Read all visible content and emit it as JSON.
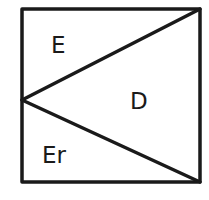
{
  "diagram": {
    "type": "square-partition",
    "stroke_color": "#1a1a1a",
    "background": "#ffffff",
    "square": {
      "x1": 22,
      "y1": 9,
      "x2": 200,
      "y2": 182
    },
    "apex": {
      "x": 22,
      "y": 100
    },
    "lines": [
      {
        "from": "apex",
        "to": "top-right"
      },
      {
        "from": "apex",
        "to": "bottom-right"
      }
    ],
    "regions": [
      {
        "id": "top-left-triangle",
        "label": "E"
      },
      {
        "id": "right-triangle",
        "label": "D"
      },
      {
        "id": "bottom-left-triangle",
        "label": "Er"
      }
    ]
  }
}
